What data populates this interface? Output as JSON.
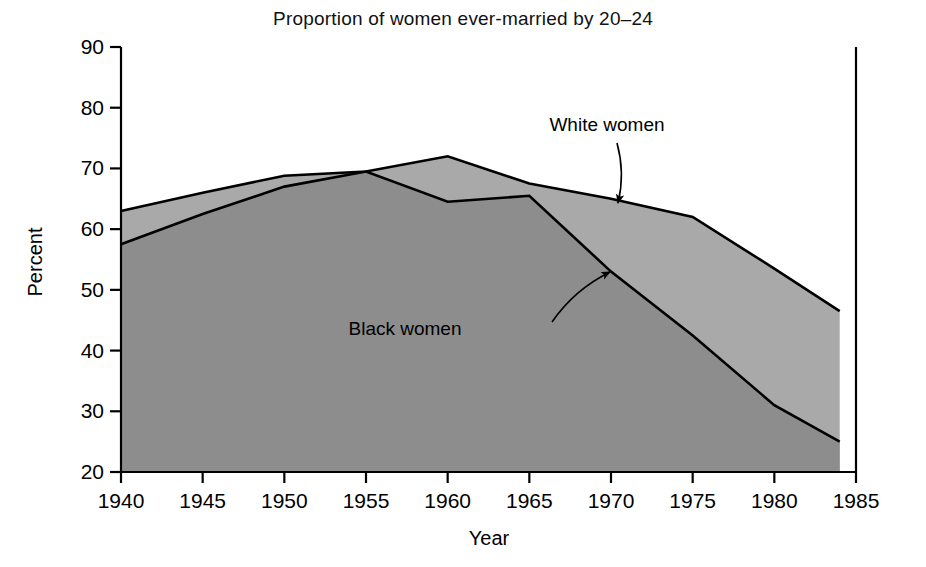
{
  "chart_data": {
    "type": "area",
    "title": "Proportion of women ever-married by 20–24",
    "xlabel": "Year",
    "ylabel": "Percent",
    "xlim": [
      1940,
      1985
    ],
    "ylim": [
      20,
      90
    ],
    "xticks": [
      1940,
      1945,
      1950,
      1955,
      1960,
      1965,
      1970,
      1975,
      1980,
      1985
    ],
    "yticks": [
      20,
      30,
      40,
      50,
      60,
      70,
      80,
      90
    ],
    "xtick_labels": [
      "1940",
      "1945",
      "1950",
      "1955",
      "1960",
      "1965",
      "1970",
      "1975",
      "1980",
      "1985"
    ],
    "ytick_labels": [
      "20",
      "30",
      "40",
      "50",
      "60",
      "70",
      "80",
      "90"
    ],
    "grid": false,
    "legend": "annotations",
    "x": [
      1940,
      1945,
      1950,
      1955,
      1960,
      1965,
      1970,
      1975,
      1980,
      1984
    ],
    "series": [
      {
        "name": "White women",
        "fill_color": "#a9a9a9",
        "line_color": "#000000",
        "values": [
          63.0,
          66.0,
          68.8,
          69.5,
          72.0,
          67.5,
          65.0,
          62.0,
          53.5,
          46.5
        ]
      },
      {
        "name": "Black women",
        "fill_color": "#8d8d8d",
        "line_color": "#000000",
        "values": [
          57.5,
          62.5,
          67.0,
          69.5,
          64.5,
          65.5,
          53.0,
          42.5,
          31.0,
          25.0
        ]
      }
    ],
    "annotations": [
      {
        "text": "White women",
        "label_x": 607,
        "label_y": 131,
        "arrow_from_x": 617,
        "arrow_from_y": 143,
        "arrow_to_x": 618,
        "arrow_to_y": 203
      },
      {
        "text": "Black women",
        "label_x": 405,
        "label_y": 335,
        "arrow_from_x": 552,
        "arrow_from_y": 322,
        "arrow_to_x": 610,
        "arrow_to_y": 272
      }
    ]
  },
  "colors": {
    "white_women_fill": "#a9a9a9",
    "black_women_fill": "#8d8d8d",
    "axis": "#000000",
    "background": "#ffffff"
  }
}
